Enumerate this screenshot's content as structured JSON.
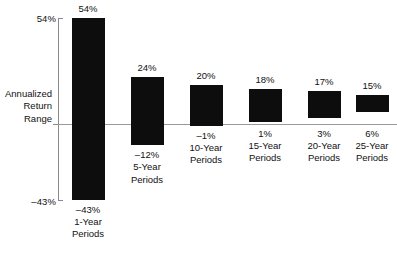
{
  "axis": {
    "title_lines": [
      "Annualized",
      "Return",
      "Range"
    ],
    "top_label": "54%",
    "bottom_label": "–43%"
  },
  "chart_data": {
    "type": "bar",
    "subtype": "floating-range-bar",
    "title": "",
    "xlabel": "",
    "ylabel": "Annualized Return Range",
    "ylim": [
      -43,
      54
    ],
    "grid": false,
    "legend": null,
    "zero_line": 0,
    "categories": [
      "1-Year Periods",
      "5-Year Periods",
      "10-Year Periods",
      "15-Year Periods",
      "20-Year Periods",
      "25-Year Periods"
    ],
    "series": [
      {
        "name": "Maximum annualized return",
        "values": [
          54,
          24,
          20,
          18,
          17,
          15
        ]
      },
      {
        "name": "Minimum annualized return",
        "values": [
          -43,
          -12,
          -1,
          1,
          3,
          6
        ]
      }
    ],
    "bars": [
      {
        "category": "1-Year",
        "period_line1": "1-Year",
        "period_line2": "Periods",
        "high": 54,
        "low": -43,
        "high_label": "54%",
        "low_label": "–43%"
      },
      {
        "category": "5-Year",
        "period_line1": "5-Year",
        "period_line2": "Periods",
        "high": 24,
        "low": -12,
        "high_label": "24%",
        "low_label": "–12%"
      },
      {
        "category": "10-Year",
        "period_line1": "10-Year",
        "period_line2": "Periods",
        "high": 20,
        "low": -1,
        "high_label": "20%",
        "low_label": "–1%"
      },
      {
        "category": "15-Year",
        "period_line1": "15-Year",
        "period_line2": "Periods",
        "high": 18,
        "low": 1,
        "high_label": "18%",
        "low_label": "1%"
      },
      {
        "category": "20-Year",
        "period_line1": "20-Year",
        "period_line2": "Periods",
        "high": 17,
        "low": 3,
        "high_label": "17%",
        "low_label": "3%"
      },
      {
        "category": "25-Year",
        "period_line1": "25-Year",
        "period_line2": "Periods",
        "high": 15,
        "low": 6,
        "high_label": "15%",
        "low_label": "6%"
      }
    ],
    "colors": {
      "bar": "#0d0d0d",
      "zero_line": "#9a9a9a",
      "axis": "#8a8a8a",
      "text": "#111111",
      "background": "#ffffff"
    }
  }
}
